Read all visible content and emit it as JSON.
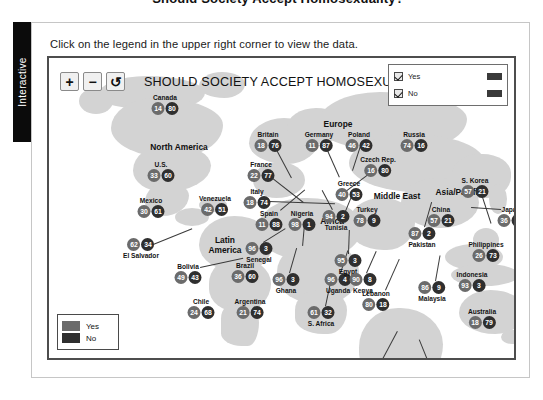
{
  "page": {
    "cropped_heading": "Should Society Accept Homosexuality?",
    "side_tab_label": "Interactive",
    "instruction": "Click on the legend in the upper right corner to view the data."
  },
  "toolbar": {
    "zoom_in_label": "+",
    "zoom_out_label": "−",
    "reset_label": "↺"
  },
  "map": {
    "title": "SHOULD SOCIETY ACCEPT HOMOSEXUALIT",
    "land_color": "#d3d3d3",
    "yes_color": "#2b2b2b",
    "no_color": "#4f4f4f"
  },
  "legend_panel": {
    "items": [
      {
        "label": "Yes",
        "checked": true,
        "color": "#3a3a3a"
      },
      {
        "label": "No",
        "checked": true,
        "color": "#3a3a3a"
      }
    ]
  },
  "legend_box": {
    "items": [
      {
        "label": "Yes",
        "color": "#6b6b6b"
      },
      {
        "label": "No",
        "color": "#2f2f2f"
      }
    ]
  },
  "regions": [
    {
      "label": "North America",
      "x": 130,
      "y": 85
    },
    {
      "label": "Europe",
      "x": 289,
      "y": 62
    },
    {
      "label": "Latin\nAmerica",
      "x": 176,
      "y": 178
    },
    {
      "label": "Africa",
      "x": 283,
      "y": 159
    },
    {
      "label": "Middle East",
      "x": 348,
      "y": 134
    },
    {
      "label": "Asia/Pacific",
      "x": 410,
      "y": 130
    }
  ],
  "chart_data": {
    "type": "map",
    "title": "SHOULD SOCIETY ACCEPT HOMOSEXUALITY?",
    "series": [
      {
        "name": "Yes",
        "color": "#6b6b6b"
      },
      {
        "name": "No",
        "color": "#2f2f2f"
      }
    ],
    "unit": "percent",
    "countries": [
      {
        "name": "Canada",
        "yes": 14,
        "no": 80
      },
      {
        "name": "U.S.",
        "yes": 33,
        "no": 60
      },
      {
        "name": "Mexico",
        "yes": 30,
        "no": 61
      },
      {
        "name": "El Salvador",
        "yes": 62,
        "no": 34
      },
      {
        "name": "Venezuela",
        "yes": 42,
        "no": 51
      },
      {
        "name": "Bolivia",
        "yes": 49,
        "no": 43
      },
      {
        "name": "Brazil",
        "yes": 36,
        "no": 60
      },
      {
        "name": "Chile",
        "yes": 24,
        "no": 68
      },
      {
        "name": "Argentina",
        "yes": 21,
        "no": 74
      },
      {
        "name": "Britain",
        "yes": 18,
        "no": 76
      },
      {
        "name": "France",
        "yes": 22,
        "no": 77
      },
      {
        "name": "Italy",
        "yes": 18,
        "no": 74
      },
      {
        "name": "Spain",
        "yes": 11,
        "no": 88
      },
      {
        "name": "Germany",
        "yes": 11,
        "no": 87
      },
      {
        "name": "Poland",
        "yes": 46,
        "no": 42
      },
      {
        "name": "Czech Rep.",
        "yes": 16,
        "no": 80
      },
      {
        "name": "Greece",
        "yes": 40,
        "no": 53
      },
      {
        "name": "Russia",
        "yes": 74,
        "no": 16
      },
      {
        "name": "Turkey",
        "yes": 78,
        "no": 9
      },
      {
        "name": "Senegal",
        "yes": 96,
        "no": 3
      },
      {
        "name": "Nigeria",
        "yes": 98,
        "no": 1
      },
      {
        "name": "Tunisia",
        "yes": 94,
        "no": 2
      },
      {
        "name": "Ghana",
        "yes": 96,
        "no": 3
      },
      {
        "name": "Uganda",
        "yes": 96,
        "no": 4
      },
      {
        "name": "Egypt",
        "yes": 95,
        "no": 3
      },
      {
        "name": "Kenya",
        "yes": 90,
        "no": 8
      },
      {
        "name": "S. Africa",
        "yes": 61,
        "no": 32
      },
      {
        "name": "Lebanon",
        "yes": 80,
        "no": 18
      },
      {
        "name": "Palest. ter.",
        "yes": 94,
        "no": 2
      },
      {
        "name": "Israel",
        "yes": 47,
        "no": 40
      },
      {
        "name": "Jordan",
        "yes": 97,
        "no": 3
      },
      {
        "name": "Pakistan",
        "yes": 87,
        "no": 2
      },
      {
        "name": "China",
        "yes": 57,
        "no": 21
      },
      {
        "name": "S. Korea",
        "yes": 57,
        "no": 21
      },
      {
        "name": "Japan",
        "yes": 36,
        "no": 54
      },
      {
        "name": "Philippines",
        "yes": 26,
        "no": 73
      },
      {
        "name": "Malaysia",
        "yes": 86,
        "no": 9
      },
      {
        "name": "Indonesia",
        "yes": 93,
        "no": 3
      },
      {
        "name": "Australia",
        "yes": 18,
        "no": 79
      }
    ]
  },
  "markers": [
    {
      "name": "Canada",
      "x": 116,
      "y": 36,
      "name_pos": "above"
    },
    {
      "name": "U.S.",
      "x": 112,
      "y": 103,
      "name_pos": "above"
    },
    {
      "name": "Mexico",
      "x": 102,
      "y": 139,
      "name_pos": "above"
    },
    {
      "name": "El Salvador",
      "x": 92,
      "y": 180,
      "name_pos": "below",
      "lx": 104,
      "ly": 186,
      "lw": 42,
      "la": -22
    },
    {
      "name": "Venezuela",
      "x": 166,
      "y": 137,
      "name_pos": "above"
    },
    {
      "name": "Bolivia",
      "x": 139,
      "y": 205,
      "name_pos": "above",
      "lx": 151,
      "ly": 209,
      "lw": 44,
      "la": -12
    },
    {
      "name": "Brazil",
      "x": 196,
      "y": 204,
      "name_pos": "above"
    },
    {
      "name": "Chile",
      "x": 152,
      "y": 240,
      "name_pos": "above"
    },
    {
      "name": "Argentina",
      "x": 201,
      "y": 240,
      "name_pos": "above"
    },
    {
      "name": "Britain",
      "x": 219,
      "y": 73,
      "name_pos": "above",
      "lx": 226,
      "ly": 88,
      "lw": 36,
      "la": 62
    },
    {
      "name": "France",
      "x": 212,
      "y": 103,
      "name_pos": "above",
      "lx": 220,
      "ly": 117,
      "lw": 44,
      "la": 38
    },
    {
      "name": "Italy",
      "x": 208,
      "y": 130,
      "name_pos": "above",
      "lx": 220,
      "ly": 143,
      "lw": 66,
      "la": 2
    },
    {
      "name": "Spain",
      "x": 220,
      "y": 152,
      "name_pos": "above",
      "lx": 231,
      "ly": 152,
      "lw": 32,
      "la": -40
    },
    {
      "name": "Germany",
      "x": 270,
      "y": 73,
      "name_pos": "above",
      "lx": 277,
      "ly": 88,
      "lw": 34,
      "la": 66
    },
    {
      "name": "Poland",
      "x": 310,
      "y": 73,
      "name_pos": "above",
      "lx": 312,
      "ly": 88,
      "lw": 26,
      "la": 108
    },
    {
      "name": "Czech Rep.",
      "x": 329,
      "y": 98,
      "name_pos": "above",
      "lx": 326,
      "ly": 112,
      "lw": 42,
      "la": 143
    },
    {
      "name": "Greece",
      "x": 300,
      "y": 122,
      "name_pos": "above",
      "lx": 304,
      "ly": 136,
      "lw": 24,
      "la": 112
    },
    {
      "name": "Russia",
      "x": 365,
      "y": 73,
      "name_pos": "above"
    },
    {
      "name": "Turkey",
      "x": 318,
      "y": 148,
      "name_pos": "above"
    },
    {
      "name": "Senegal",
      "x": 210,
      "y": 184,
      "name_pos": "below",
      "lx": 214,
      "ly": 184,
      "lw": 26,
      "la": -32
    },
    {
      "name": "Nigeria",
      "x": 253,
      "y": 152,
      "name_pos": "above",
      "lx": 256,
      "ly": 166,
      "lw": 22,
      "la": 95
    },
    {
      "name": "Tunisia",
      "x": 287,
      "y": 152,
      "name_pos": "below",
      "lx": 283,
      "ly": 152,
      "lw": 22,
      "la": -118
    },
    {
      "name": "Ghana",
      "x": 237,
      "y": 215,
      "name_pos": "below",
      "lx": 240,
      "ly": 215,
      "lw": 26,
      "la": -74
    },
    {
      "name": "Uganda",
      "x": 289,
      "y": 215,
      "name_pos": "below",
      "lx": 291,
      "ly": 215,
      "lw": 24,
      "la": -72
    },
    {
      "name": "Egypt",
      "x": 299,
      "y": 196,
      "name_pos": "below",
      "lx": 299,
      "ly": 196,
      "lw": 24,
      "la": -88
    },
    {
      "name": "Kenya",
      "x": 314,
      "y": 215,
      "name_pos": "below",
      "lx": 317,
      "ly": 215,
      "lw": 24,
      "la": -66
    },
    {
      "name": "S. Africa",
      "x": 272,
      "y": 248,
      "name_pos": "below",
      "lx": 276,
      "ly": 248,
      "lw": 26,
      "la": -78
    },
    {
      "name": "Lebanon",
      "x": 327,
      "y": 232,
      "name_pos": "above",
      "lx": 336,
      "ly": 232,
      "lw": 34,
      "la": -66
    },
    {
      "name": "Palest. ter.",
      "x": 322,
      "y": 303,
      "name_pos": "above",
      "lx": 332,
      "ly": 303,
      "lw": 34,
      "la": -62
    },
    {
      "name": "Israel",
      "x": 322,
      "y": 324,
      "name_pos": "below",
      "lx": 334,
      "ly": 326,
      "lw": 30,
      "la": -54
    },
    {
      "name": "Jordan",
      "x": 386,
      "y": 317,
      "name_pos": "above",
      "lx": 384,
      "ly": 317,
      "lw": 38,
      "la": -112
    },
    {
      "name": "Pakistan",
      "x": 373,
      "y": 169,
      "name_pos": "below",
      "lx": 375,
      "ly": 169,
      "lw": 26,
      "la": -74
    },
    {
      "name": "China",
      "x": 392,
      "y": 148,
      "name_pos": "above"
    },
    {
      "name": "S. Korea",
      "x": 426,
      "y": 119,
      "name_pos": "above",
      "lx": 432,
      "ly": 133,
      "lw": 34,
      "la": 72
    },
    {
      "name": "Japan",
      "x": 462,
      "y": 148,
      "name_pos": "above",
      "lx": 452,
      "ly": 152,
      "lw": 30,
      "la": -176
    },
    {
      "name": "Philippines",
      "x": 437,
      "y": 183,
      "name_pos": "above"
    },
    {
      "name": "Malaysia",
      "x": 383,
      "y": 223,
      "name_pos": "below",
      "lx": 386,
      "ly": 223,
      "lw": 26,
      "la": -80
    },
    {
      "name": "Indonesia",
      "x": 423,
      "y": 213,
      "name_pos": "above"
    },
    {
      "name": "Australia",
      "x": 433,
      "y": 250,
      "name_pos": "above"
    }
  ]
}
